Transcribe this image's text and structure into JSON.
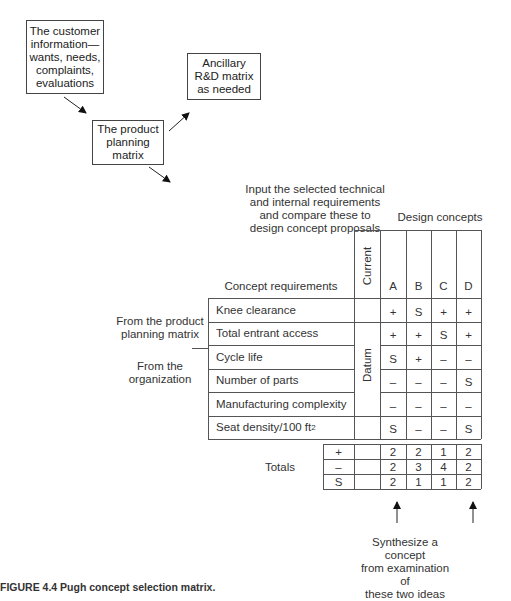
{
  "flow": {
    "customer_box": [
      "The customer",
      "information—",
      "wants, needs,",
      "complaints,",
      "evaluations"
    ],
    "planning_box": [
      "The product",
      "planning",
      "matrix"
    ],
    "ancillary_box": [
      "Ancillary",
      "R&D matrix",
      "as needed"
    ],
    "input_note": [
      "Input the selected technical",
      "and internal requirements",
      "and compare these to",
      "design concept proposals"
    ]
  },
  "matrix": {
    "title": "Design concepts",
    "requirements_header": "Concept requirements",
    "current_header": "Current",
    "datum_label": "Datum",
    "concepts": [
      "A",
      "B",
      "C",
      "D"
    ],
    "side_labels": {
      "product_planning": [
        "From the product",
        "planning matrix"
      ],
      "organization": [
        "From the",
        "organization"
      ]
    },
    "rows": [
      {
        "label": "Knee clearance",
        "values": [
          "+",
          "S",
          "+",
          "+"
        ]
      },
      {
        "label": "Total entrant access",
        "values": [
          "+",
          "+",
          "S",
          "+"
        ]
      },
      {
        "label": "Cycle life",
        "values": [
          "S",
          "+",
          "–",
          "–"
        ]
      },
      {
        "label": "Number of parts",
        "values": [
          "–",
          "–",
          "–",
          "S"
        ]
      },
      {
        "label": "Manufacturing complexity",
        "values": [
          "–",
          "–",
          "–",
          "–"
        ]
      },
      {
        "label": "Seat density/100 ft",
        "sup": "2",
        "values": [
          "S",
          "–",
          "–",
          "S"
        ]
      }
    ],
    "totals_label": "Totals",
    "totals": [
      {
        "symbol": "+",
        "values": [
          "2",
          "2",
          "1",
          "2"
        ]
      },
      {
        "symbol": "–",
        "values": [
          "2",
          "3",
          "4",
          "2"
        ]
      },
      {
        "symbol": "S",
        "values": [
          "2",
          "1",
          "1",
          "2"
        ]
      }
    ]
  },
  "synthesize_note": [
    "Synthesize a concept",
    "from examination of",
    "these two ideas"
  ],
  "caption": "FIGURE 4.4  Pugh concept selection matrix."
}
